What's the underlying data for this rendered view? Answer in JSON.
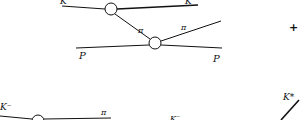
{
  "diagram": {
    "type": "feynman-diagram",
    "top_graph": {
      "labels": {
        "K_in": "K",
        "pi_internal": "π",
        "pi_out": "π",
        "P_in": "P",
        "P_out": "P"
      },
      "vertices": [
        {
          "id": "v1",
          "cx": 111,
          "cy": 9,
          "r": 6
        },
        {
          "id": "v2",
          "cx": 155,
          "cy": 43,
          "r": 6
        }
      ]
    },
    "operator": "+",
    "bottom_graph": {
      "labels": {
        "K_minus_in": "K⁻",
        "pi_out": "π",
        "K_minus_mid": "K⁻",
        "K_star": "K*"
      },
      "vertices": [
        {
          "id": "v3",
          "cx": 38,
          "cy": 121,
          "r": 6
        }
      ]
    },
    "colors": {
      "line": "#111111",
      "background": "#ffffff"
    }
  }
}
